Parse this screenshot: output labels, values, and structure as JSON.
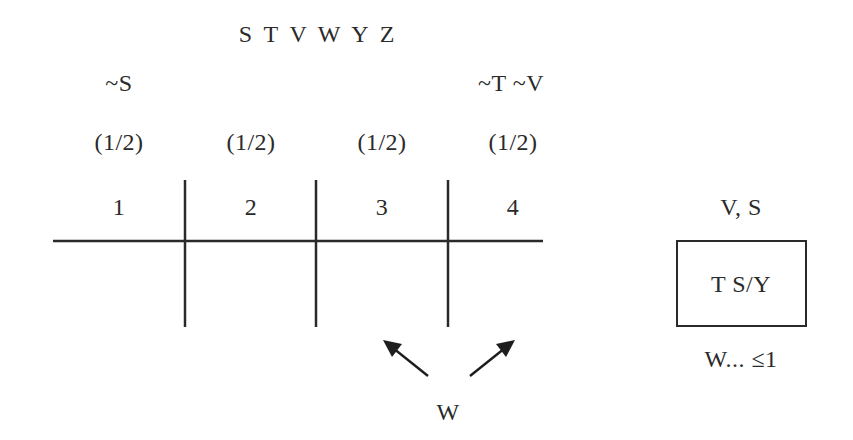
{
  "header": {
    "variables": "S T V W Y Z"
  },
  "columns": [
    {
      "number": "1",
      "fraction": "(1/2)",
      "condition": "~S"
    },
    {
      "number": "2",
      "fraction": "(1/2)",
      "condition": ""
    },
    {
      "number": "3",
      "fraction": "(1/2)",
      "condition": ""
    },
    {
      "number": "4",
      "fraction": "(1/2)",
      "condition": "~T ~V"
    }
  ],
  "arrows": {
    "label": "W",
    "targets": [
      "between-2-3",
      "between-3-4"
    ]
  },
  "side_box": {
    "above_label": "V, S",
    "content": "T S/Y",
    "below_label": "W... ≤1"
  }
}
